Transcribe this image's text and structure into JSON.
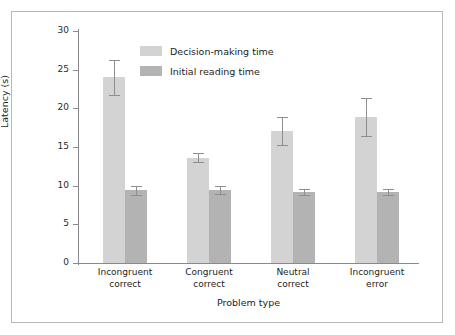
{
  "chart_data": {
    "type": "bar",
    "title": "",
    "xlabel": "Problem type",
    "ylabel": "Latency (s)",
    "ylim": [
      0,
      30
    ],
    "yticks": [
      0,
      5,
      10,
      15,
      20,
      25,
      30
    ],
    "ytick_labels": [
      "0",
      "5",
      "10",
      "15",
      "20",
      "25",
      "30"
    ],
    "grid": false,
    "legend_position": "upper-center-left",
    "categories": [
      "Incongruent correct",
      "Congruent correct",
      "Neutral correct",
      "Incongruent error"
    ],
    "category_lines": [
      [
        "Incongruent",
        "correct"
      ],
      [
        "Congruent",
        "correct"
      ],
      [
        "Neutral",
        "correct"
      ],
      [
        "Incongruent",
        "error"
      ]
    ],
    "series": [
      {
        "name": "Decision-making time",
        "color": "#d3d3d3",
        "values": [
          24.0,
          13.6,
          17.1,
          18.9
        ],
        "errors": [
          2.3,
          0.6,
          1.8,
          2.5
        ]
      },
      {
        "name": "Initial reading time",
        "color": "#b3b3b3",
        "values": [
          9.4,
          9.4,
          9.2,
          9.2
        ],
        "errors": [
          0.6,
          0.5,
          0.4,
          0.4
        ]
      }
    ]
  },
  "legend": {
    "items": [
      {
        "label": "Decision-making time",
        "color": "#d3d3d3"
      },
      {
        "label": "Initial reading time",
        "color": "#b3b3b3"
      }
    ]
  },
  "axes": {
    "y_title": "Latency (s)",
    "x_title": "Problem type"
  }
}
